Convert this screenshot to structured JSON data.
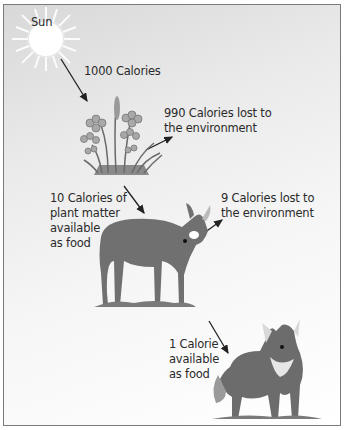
{
  "diagram": {
    "sun": {
      "label": "Sun"
    },
    "energy_input": {
      "label": "1000 Calories"
    },
    "plant_loss": {
      "label": "990 Calories lost to\nthe environment"
    },
    "plant_available": {
      "label": "10 Calories of\nplant matter\navailable\nas food"
    },
    "deer_loss": {
      "label": "9 Calories lost to\nthe environment"
    },
    "wolf_available": {
      "label": "1 Calorie\navailable\nas food"
    },
    "organisms": [
      "sun",
      "plants",
      "deer",
      "wolf"
    ],
    "colors": {
      "border": "#7a7a7a",
      "text": "#2a2a2a",
      "animal": "#6e6e6e",
      "arrow": "#222222"
    }
  }
}
